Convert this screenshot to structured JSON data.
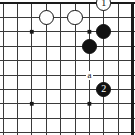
{
  "diagram": {
    "kind": "go-board-diagram",
    "board": {
      "cols": 9,
      "rows": 9,
      "origin_x": 3,
      "origin_y": 3,
      "spacing": 14.4,
      "line_color": "#3a3a3a",
      "edge_color": "#1a1a1a",
      "edge_width": 2.6,
      "line_width": 1.0,
      "background": "#ffffff",
      "top_edge": true,
      "right_edge": true,
      "bottom_edge": false,
      "left_edge": false
    },
    "star_points": [
      {
        "col": 2,
        "row": 2
      },
      {
        "col": 2,
        "row": 7
      },
      {
        "col": 6,
        "row": 7
      },
      {
        "col": 6,
        "row": 2
      }
    ],
    "stones": [
      {
        "id": "white-stone-left",
        "color": "white",
        "label": "",
        "col": 3,
        "row": 1
      },
      {
        "id": "white-stone-right",
        "color": "white",
        "label": "",
        "col": 5,
        "row": 1
      },
      {
        "id": "white-stone-1",
        "color": "white",
        "label": "1",
        "col": 7,
        "row": 0
      },
      {
        "id": "black-stone-upper",
        "color": "black",
        "label": "",
        "col": 7,
        "row": 2
      },
      {
        "id": "black-stone-lower",
        "color": "black",
        "label": "",
        "col": 6,
        "row": 3
      },
      {
        "id": "black-stone-2",
        "color": "black",
        "label": "2",
        "col": 7,
        "row": 6
      }
    ],
    "point_labels": [
      {
        "id": "label-a",
        "text": "a",
        "col": 6,
        "row": 5
      }
    ],
    "move_numbers": [
      "1",
      "2"
    ],
    "stone_radius": 7.6,
    "star_radius": 1.9
  }
}
